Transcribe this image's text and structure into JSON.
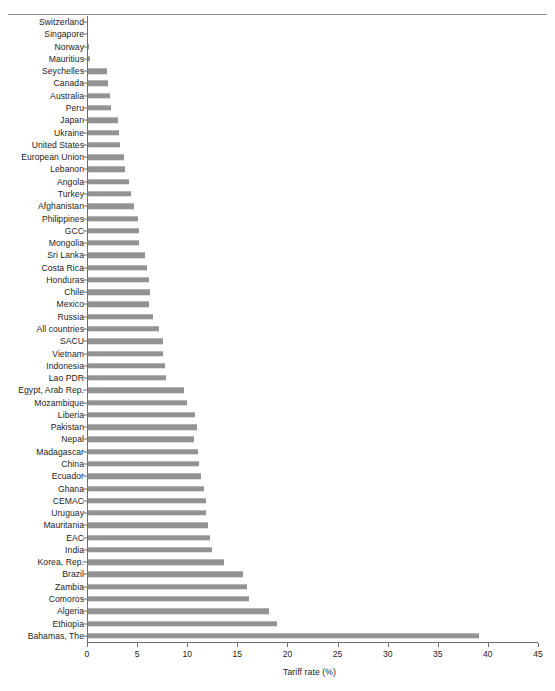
{
  "chart_data": {
    "type": "bar",
    "orientation": "horizontal",
    "title": "",
    "xlabel": "Tariff rate (%)",
    "ylabel": "",
    "xlim": [
      0,
      45
    ],
    "xticks": [
      0,
      5,
      10,
      15,
      20,
      25,
      30,
      35,
      40,
      45
    ],
    "grid": false,
    "legend": null,
    "bar_color": "#939393",
    "axis_color": "#6f6f6f",
    "categories": [
      "Switzerland",
      "Singapore",
      "Norway",
      "Mauritius",
      "Seychelles",
      "Canada",
      "Australia",
      "Peru",
      "Japan",
      "Ukraine",
      "United States",
      "European Union",
      "Lebanon",
      "Angola",
      "Turkey",
      "Afghanistan",
      "Philippines",
      "GCC",
      "Mongolia",
      "Sri Lanka",
      "Costa Rica",
      "Honduras",
      "Chile",
      "Mexico",
      "Russia",
      "All countries",
      "SACU",
      "Vietnam",
      "Indonesia",
      "Lao PDR",
      "Egypt, Arab Rep.",
      "Mozambique",
      "Liberia",
      "Pakistan",
      "Nepal",
      "Madagascar",
      "China",
      "Ecuador",
      "Ghana",
      "CEMAC",
      "Uruguay",
      "Mauritania",
      "EAC",
      "India",
      "Korea, Rep.",
      "Brazil",
      "Zambia",
      "Comoros",
      "Algeria",
      "Ethiopia",
      "Bahamas, The"
    ],
    "values": [
      0.0,
      0.1,
      0.2,
      0.3,
      2.0,
      2.1,
      2.3,
      2.4,
      3.1,
      3.2,
      3.3,
      3.7,
      3.8,
      4.2,
      4.4,
      4.7,
      5.1,
      5.2,
      5.2,
      5.8,
      6.0,
      6.2,
      6.3,
      6.2,
      6.6,
      7.2,
      7.6,
      7.6,
      7.8,
      7.9,
      9.7,
      10.0,
      10.8,
      11.0,
      10.7,
      11.1,
      11.2,
      11.4,
      11.7,
      11.9,
      11.9,
      12.1,
      12.3,
      12.5,
      13.7,
      15.6,
      16.0,
      16.2,
      18.2,
      19.0,
      39.1
    ]
  }
}
